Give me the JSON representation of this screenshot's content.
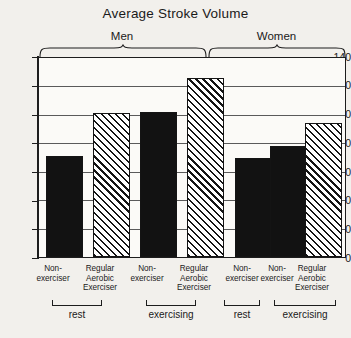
{
  "chart_data": {
    "type": "bar",
    "title": "Average Stroke Volume",
    "xlabel": "",
    "ylabel": "",
    "ylim": [
      0,
      140
    ],
    "yticks": [
      0,
      20,
      40,
      60,
      80,
      100,
      120,
      140
    ],
    "grid": true,
    "legend": "none",
    "categories": [
      "Non-exerciser",
      "Regular Aerobic Exerciser",
      "Non-exerciser",
      "Regular Aerobic Exerciser",
      "Non-exerciser",
      "Non-exerciser",
      "Regular Aerobic Exerciser"
    ],
    "values": [
      71,
      101,
      102,
      126,
      70,
      78,
      94
    ],
    "fills": [
      "solid",
      "hatch",
      "solid",
      "hatch",
      "solid",
      "solid",
      "hatch"
    ],
    "top_groups": [
      {
        "label": "Men",
        "bars": [
          0,
          1,
          2,
          3
        ]
      },
      {
        "label": "Women",
        "bars": [
          4,
          5,
          6
        ]
      }
    ],
    "bottom_groups": [
      {
        "label": "rest",
        "bars": [
          0,
          1
        ]
      },
      {
        "label": "exercising",
        "bars": [
          2,
          3
        ]
      },
      {
        "label": "rest",
        "bars": [
          4
        ]
      },
      {
        "label": "exercising",
        "bars": [
          5,
          6
        ]
      }
    ]
  },
  "axis": {
    "tick_140": "140",
    "tick_120": "120",
    "tick_100": "100",
    "tick_80": "80",
    "tick_60": "60",
    "tick_40": "40",
    "tick_20": "20",
    "tick_0": "0"
  },
  "braces": {
    "men": "Men",
    "women": "Women"
  },
  "xlabels": {
    "b0": "Non-\nexerciser",
    "b1": "Regular\nAerobic\nExerciser",
    "b2": "Non-\nexerciser",
    "b3": "Regular\nAerobic\nExerciser",
    "b4": "Non-\nexerciser",
    "b5": "Non-\nexerciser",
    "b6": "Regular\nAerobic\nExerciser"
  },
  "brackets": {
    "g0": "rest",
    "g1": "exercising",
    "g2": "rest",
    "g3": "exercising"
  },
  "colors": {
    "ink": "#141414",
    "paper": "#f2f0ec",
    "plot_bg": "#fbfaf7",
    "grid": "#5a5a5a"
  }
}
